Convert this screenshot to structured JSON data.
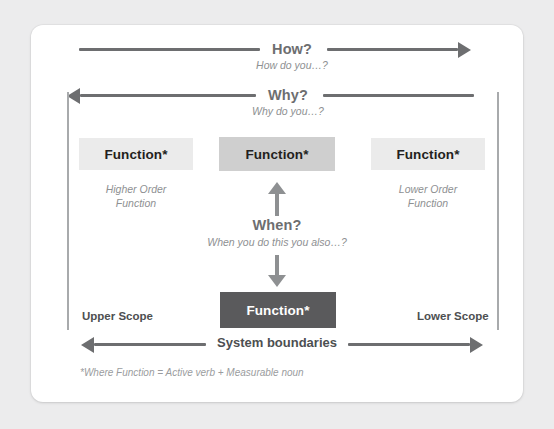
{
  "diagram": {
    "title_rows": {
      "how": {
        "label": "How?",
        "sub": "How do you…?"
      },
      "why": {
        "label": "Why?",
        "sub": "Why do you…?"
      },
      "when": {
        "label": "When?",
        "sub": "When you do this you also…?"
      }
    },
    "boxes": {
      "higher_order": {
        "label": "Function*",
        "tone": "light"
      },
      "center": {
        "label": "Function*",
        "tone": "mid"
      },
      "lower_order": {
        "label": "Function*",
        "tone": "light"
      },
      "sub_function": {
        "label": "Function*",
        "tone": "dark"
      }
    },
    "side_notes": {
      "left": "Higher Order\nFunction",
      "right": "Lower Order\nFunction"
    },
    "scopes": {
      "upper": "Upper Scope",
      "lower": "Lower Scope"
    },
    "system_boundaries_label": "System boundaries",
    "footnote": "*Where Function = Active verb + Measurable noun",
    "colors": {
      "page_background": "#ececed",
      "card_background": "#ffffff",
      "arrow": "#6d6e70",
      "center_arrow": "#8e9092",
      "boundary_line": "#a8aaac",
      "box_light": "#ebebeb",
      "box_mid": "#cfcfcf",
      "box_dark": "#5a5a5c",
      "heading_text": "#6d6e70",
      "muted_text": "#8e9092",
      "strong_text": "#4d4f51"
    }
  }
}
